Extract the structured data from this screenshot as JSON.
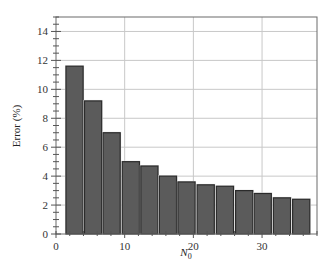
{
  "chart_data": {
    "type": "bar",
    "title": "",
    "xlabel": "N",
    "xlabel_subscript": "0",
    "ylabel": "Error (%)",
    "xlim": [
      0,
      38
    ],
    "ylim": [
      0,
      15
    ],
    "xticks": [
      0,
      10,
      20,
      30
    ],
    "yticks": [
      0,
      2,
      4,
      6,
      8,
      10,
      12,
      14
    ],
    "grid": true,
    "legend": null,
    "x": [
      2.7,
      5.4,
      8.1,
      10.9,
      13.6,
      16.3,
      19.0,
      21.8,
      24.6,
      27.4,
      30.1,
      32.9,
      35.7
    ],
    "values": [
      11.6,
      9.2,
      7.0,
      5.0,
      4.7,
      4.0,
      3.6,
      3.4,
      3.3,
      3.0,
      2.8,
      2.5,
      2.4
    ],
    "bar_width_units": 2.5,
    "colors": {
      "bar_fill": "#5b5b5b",
      "bar_edge": "#2b2b2b",
      "grid": "#c8c8c8",
      "axis": "#555555"
    }
  }
}
